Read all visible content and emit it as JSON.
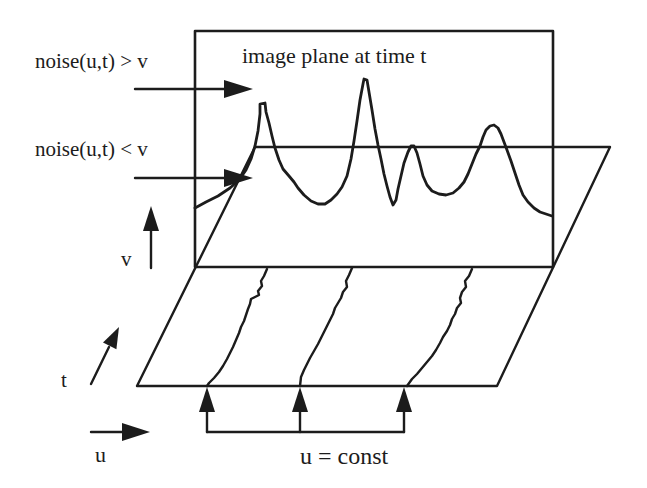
{
  "figure": {
    "labels": {
      "above_threshold": "noise(u,t) > v",
      "below_threshold": "noise(u,t) < v",
      "image_plane": "image plane at time t",
      "v_axis": "v",
      "t_axis": "t",
      "u_axis": "u",
      "u_const": "u = const"
    },
    "colors": {
      "background": "#ffffff",
      "ink": "#1c1c1c"
    }
  }
}
